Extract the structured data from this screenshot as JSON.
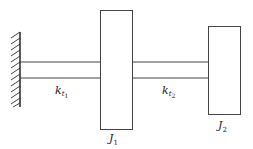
{
  "diagram": {
    "wall": {
      "name": "fixed-wall"
    },
    "shafts": [
      {
        "id": "shaft-1",
        "label_main": "k",
        "label_sub1": "t",
        "label_sub2": "1"
      },
      {
        "id": "shaft-2",
        "label_main": "k",
        "label_sub1": "t",
        "label_sub2": "2"
      }
    ],
    "inertias": [
      {
        "id": "disk-1",
        "label_main": "J",
        "label_sub": "1"
      },
      {
        "id": "disk-2",
        "label_main": "J",
        "label_sub": "2"
      }
    ],
    "colors": {
      "stroke": "#333333",
      "background": "#ffffff"
    }
  }
}
